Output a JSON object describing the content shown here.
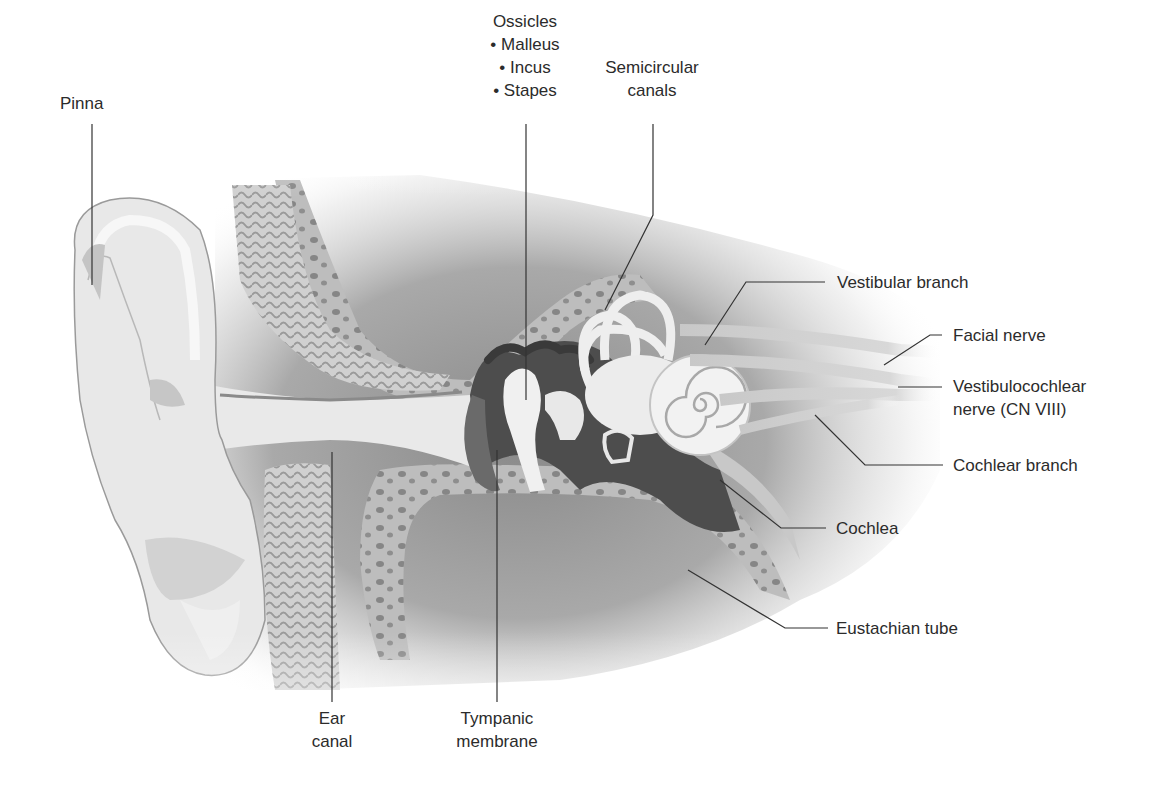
{
  "figure": {
    "colors": {
      "background": "#ffffff",
      "label_text": "#2b2b2b",
      "leader_line": "#333333",
      "soft_tissue": "#e4e4e4",
      "bone": "#bdbdbd",
      "bone_pores": "#6e6e6e",
      "cavity_dark": "#5a5a5a",
      "membrane_light": "#f2f2f2"
    }
  },
  "labels": {
    "pinna": {
      "lines": [
        "Pinna"
      ]
    },
    "ossicles": {
      "lines": [
        "Ossicles",
        "• Malleus",
        "• Incus",
        "• Stapes"
      ]
    },
    "semicircular_canals": {
      "lines": [
        "Semicircular",
        "canals"
      ]
    },
    "vestibular_branch": {
      "lines": [
        "Vestibular branch"
      ]
    },
    "facial_nerve": {
      "lines": [
        "Facial nerve"
      ]
    },
    "vestibulocochlear_nerve": {
      "lines": [
        "Vestibulocochlear",
        "nerve (CN VIII)"
      ]
    },
    "cochlear_branch": {
      "lines": [
        "Cochlear branch"
      ]
    },
    "cochlea": {
      "lines": [
        "Cochlea"
      ]
    },
    "eustachian_tube": {
      "lines": [
        "Eustachian tube"
      ]
    },
    "ear_canal": {
      "lines": [
        "Ear",
        "canal"
      ]
    },
    "tympanic_membrane": {
      "lines": [
        "Tympanic",
        "membrane"
      ]
    }
  }
}
